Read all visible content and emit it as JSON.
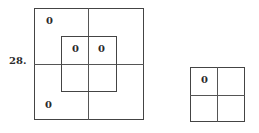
{
  "problem": {
    "number_label": "28.",
    "large_figure": {
      "cells": [
        {
          "position": "outer-top-left",
          "value": "0"
        },
        {
          "position": "inner-top-left",
          "value": "0"
        },
        {
          "position": "inner-top-right",
          "value": "0"
        },
        {
          "position": "outer-bottom-left",
          "value": "0"
        }
      ]
    },
    "small_figure": {
      "cells": [
        {
          "position": "top-left",
          "value": "0"
        }
      ]
    }
  }
}
